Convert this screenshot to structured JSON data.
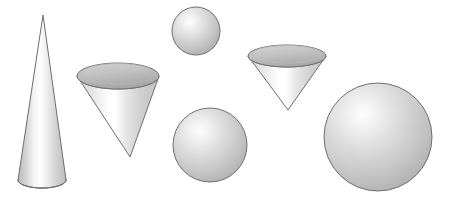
{
  "figure": {
    "title": "Geometric solids: cones and spheres",
    "background_color": "#ffffff",
    "width": 449,
    "height": 202,
    "outline_color": "#6f6f6f",
    "shading": {
      "highlight_color": "#ffffff",
      "midtone_color": "#d8d8d8",
      "shadow_color": "#9a9a9a",
      "deep_shadow_color": "#8c8c8c",
      "cone_top_face_light": "#cfcfcf",
      "cone_top_face_dark": "#a8a8a8"
    },
    "shapes": [
      {
        "id": "cone-upright-tall",
        "label": "Tall upright cone",
        "kind": "cone",
        "orientation": "upright",
        "apex_x": 43,
        "apex_y": 15,
        "base_center_x": 42,
        "base_center_y": 180,
        "base_rx": 24,
        "base_ry": 8
      },
      {
        "id": "cone-inverted-large",
        "label": "Large inverted cone",
        "kind": "cone",
        "orientation": "inverted",
        "apex_x": 130,
        "apex_y": 157,
        "base_center_x": 118,
        "base_center_y": 76,
        "base_rx": 41,
        "base_ry": 13
      },
      {
        "id": "sphere-small",
        "label": "Small sphere",
        "kind": "sphere",
        "center_x": 196,
        "center_y": 31,
        "radius": 24,
        "highlight_x": 186,
        "highlight_y": 20
      },
      {
        "id": "cone-inverted-small",
        "label": "Small inverted cone",
        "kind": "cone",
        "orientation": "inverted",
        "apex_x": 288,
        "apex_y": 110,
        "base_center_x": 287,
        "base_center_y": 56,
        "base_rx": 39,
        "base_ry": 11
      },
      {
        "id": "sphere-medium",
        "label": "Medium sphere",
        "kind": "sphere",
        "center_x": 210,
        "center_y": 145,
        "radius": 37,
        "highlight_x": 196,
        "highlight_y": 131
      },
      {
        "id": "sphere-large",
        "label": "Large sphere",
        "kind": "sphere",
        "center_x": 378,
        "center_y": 137,
        "radius": 54,
        "highlight_x": 355,
        "highlight_y": 115
      }
    ]
  }
}
